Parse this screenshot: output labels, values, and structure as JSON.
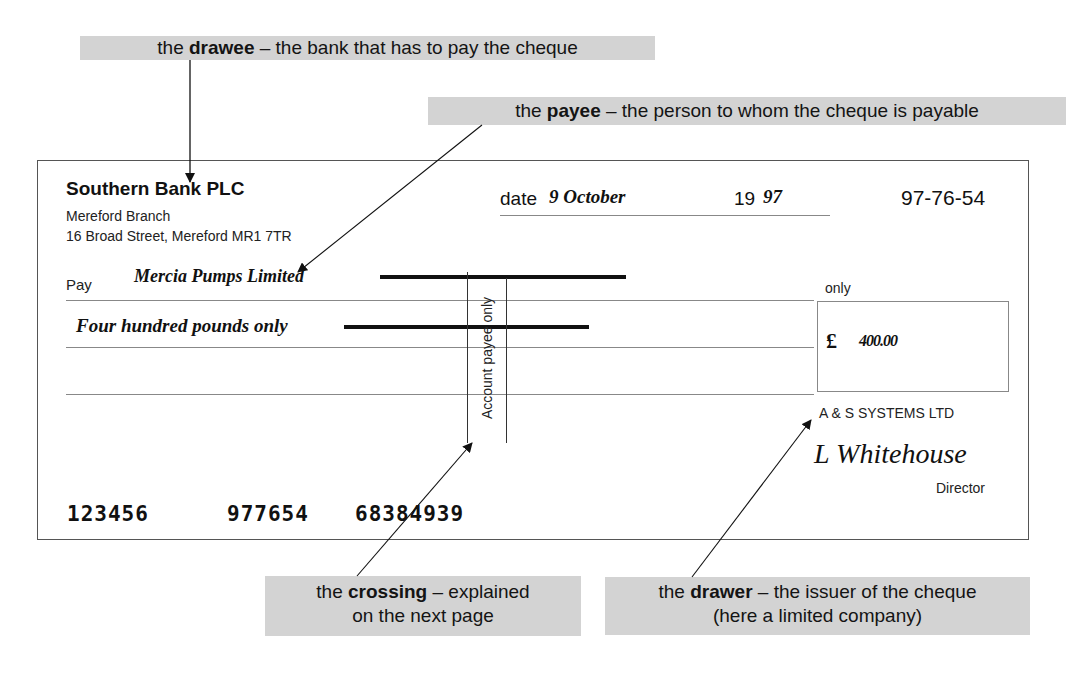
{
  "annotations": {
    "drawee": {
      "term": "drawee",
      "prefix": "the ",
      "suffix": " – the bank that has to pay the cheque"
    },
    "payee": {
      "term": "payee",
      "prefix": "the ",
      "suffix": " – the person to whom the cheque is payable"
    },
    "crossing": {
      "term": "crossing",
      "prefix": "the ",
      "suffix": " – explained",
      "line2": "on the next page"
    },
    "drawer": {
      "term": "drawer",
      "prefix": "the ",
      "suffix": " – the issuer of the cheque",
      "line2": "(here a limited company)"
    }
  },
  "cheque": {
    "bank_name": "Southern Bank PLC",
    "branch": "Mereford Branch",
    "address": "16 Broad Street, Mereford MR1 7TR",
    "date_label": "date",
    "date_value": "9 October",
    "year_prefix": "19",
    "year_value": "97",
    "sort_code": "97-76-54",
    "pay_label": "Pay",
    "payee_name": "Mercia Pumps Limited",
    "amount_words": "Four hundred pounds only",
    "only_label": "only",
    "currency_symbol": "£",
    "amount_figures": "400.00",
    "crossing_text": "Account payee only",
    "company_name": "A & S SYSTEMS LTD",
    "signature": "L Whitehouse",
    "signatory_title": "Director",
    "cheque_number": "123456",
    "branch_code": "977654",
    "account_number": "68384939"
  },
  "colors": {
    "label_background": "#d3d3d3",
    "ink": "#111111",
    "rule": "#888888"
  }
}
